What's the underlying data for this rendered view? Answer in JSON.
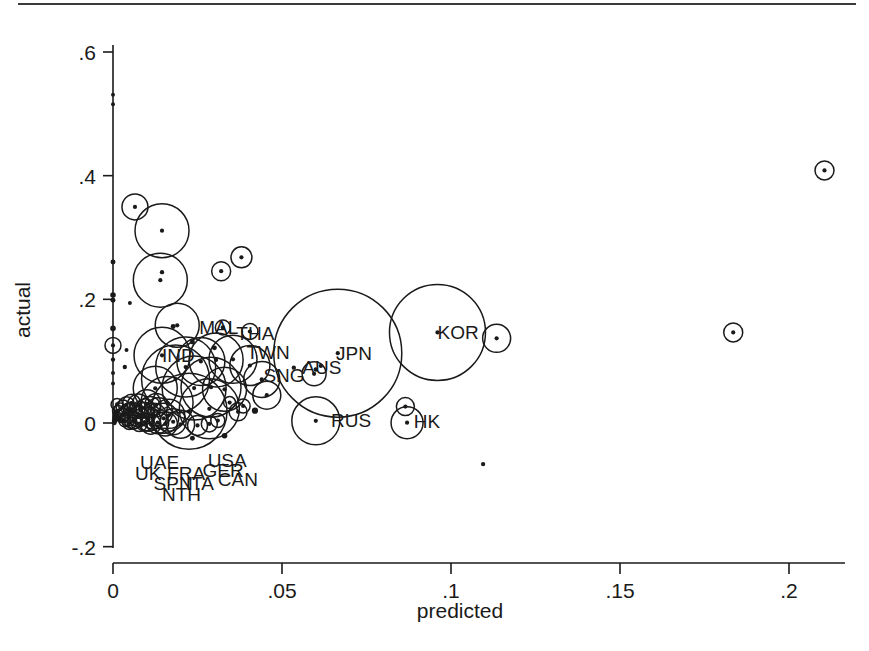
{
  "figure": {
    "type": "scatter-bubble-plot",
    "background": "#ffffff",
    "ink_color": "#1a1a1a"
  },
  "chart_data": {
    "type": "scatter",
    "title": "",
    "subtitle": "",
    "xlabel": "predicted",
    "ylabel": "actual",
    "xlim": [
      -0.006,
      0.215
    ],
    "ylim": [
      -0.21,
      0.64
    ],
    "xticks": [
      "0",
      ".05",
      ".1",
      ".15",
      ".2"
    ],
    "xtick_values": [
      0,
      0.05,
      0.1,
      0.15,
      0.2
    ],
    "yticks": [
      ".6",
      ".4",
      ".2",
      "0",
      "-.2"
    ],
    "ytick_values": [
      0.6,
      0.4,
      0.2,
      0,
      -0.2
    ],
    "grid": false,
    "legend": null,
    "marker": "circle-with-center-dot",
    "size_encoding": "bubble radius encodes weight (e.g. trade share / size)",
    "annotations": [
      {
        "text": "MAL",
        "x": 0.0255,
        "y": 0.1555
      },
      {
        "text": "THA",
        "x": 0.0365,
        "y": 0.1455
      },
      {
        "text": "TWN",
        "x": 0.0395,
        "y": 0.1155
      },
      {
        "text": "IND",
        "x": 0.0145,
        "y": 0.1105
      },
      {
        "text": "SNG",
        "x": 0.0445,
        "y": 0.0775
      },
      {
        "text": "AUS",
        "x": 0.056,
        "y": 0.0905
      },
      {
        "text": "JPN",
        "x": 0.066,
        "y": 0.1125
      },
      {
        "text": "KOR",
        "x": 0.096,
        "y": 0.1465
      },
      {
        "text": "RUS",
        "x": 0.0645,
        "y": 0.0055
      },
      {
        "text": "HK",
        "x": 0.089,
        "y": 0.0025
      },
      {
        "text": "UAE",
        "x": 0.008,
        "y": -0.0635
      },
      {
        "text": "USA",
        "x": 0.028,
        "y": -0.0595
      },
      {
        "text": "UK",
        "x": 0.0065,
        "y": -0.0815
      },
      {
        "text": "FRA",
        "x": 0.016,
        "y": -0.0805
      },
      {
        "text": "GER",
        "x": 0.0265,
        "y": -0.0765
      },
      {
        "text": "SPN",
        "x": 0.012,
        "y": -0.0975
      },
      {
        "text": "ITA",
        "x": 0.0215,
        "y": -0.0975
      },
      {
        "text": "CAN",
        "x": 0.031,
        "y": -0.0905
      },
      {
        "text": "NTH",
        "x": 0.0145,
        "y": -0.1155
      }
    ],
    "points": [
      {
        "x": 0.0,
        "y": 0.531,
        "r": 3.0
      },
      {
        "x": 0.0,
        "y": 0.5155,
        "r": 3.0
      },
      {
        "x": 0.0065,
        "y": 0.3495,
        "r": 13.0
      },
      {
        "x": 0.0,
        "y": 0.2605,
        "r": 4.0
      },
      {
        "x": 0.014,
        "y": 0.231,
        "r": 27.0
      },
      {
        "x": 0.0,
        "y": 0.207,
        "r": 4.5
      },
      {
        "x": 0.0,
        "y": 0.1985,
        "r": 4.0
      },
      {
        "x": 0.005,
        "y": 0.194,
        "r": 3.0
      },
      {
        "x": 0.0,
        "y": 0.153,
        "r": 4.5
      },
      {
        "x": 0.0,
        "y": 0.1255,
        "r": 8.0
      },
      {
        "x": 0.004,
        "y": 0.118,
        "r": 3.0
      },
      {
        "x": 0.0,
        "y": 0.1025,
        "r": 3.5
      },
      {
        "x": 0.0035,
        "y": 0.0905,
        "r": 3.5
      },
      {
        "x": 0.0,
        "y": 0.081,
        "r": 3.0
      },
      {
        "x": 0.0,
        "y": 0.064,
        "r": 3.0
      },
      {
        "x": 0.0145,
        "y": 0.311,
        "r": 27.0
      },
      {
        "x": 0.0145,
        "y": 0.244,
        "r": 3.5
      },
      {
        "x": 0.032,
        "y": 0.2455,
        "r": 9.5
      },
      {
        "x": 0.038,
        "y": 0.268,
        "r": 10.5
      },
      {
        "x": 0.019,
        "y": 0.158,
        "r": 22.0
      },
      {
        "x": 0.0325,
        "y": 0.1545,
        "r": 7.5
      },
      {
        "x": 0.0665,
        "y": 0.113,
        "r": 64.0
      },
      {
        "x": 0.096,
        "y": 0.1465,
        "r": 48.0
      },
      {
        "x": 0.1135,
        "y": 0.137,
        "r": 14.0
      },
      {
        "x": 0.1835,
        "y": 0.1465,
        "r": 9.5
      },
      {
        "x": 0.2105,
        "y": 0.4085,
        "r": 9.5
      },
      {
        "x": 0.0595,
        "y": 0.0795,
        "r": 12.0
      },
      {
        "x": 0.0535,
        "y": 0.0895,
        "r": 3.5
      },
      {
        "x": 0.0615,
        "y": 0.0925,
        "r": 3.5
      },
      {
        "x": 0.06,
        "y": 0.0865,
        "r": 3.5
      },
      {
        "x": 0.06,
        "y": 0.0035,
        "r": 24.0
      },
      {
        "x": 0.087,
        "y": 0.0005,
        "r": 16.0
      },
      {
        "x": 0.0865,
        "y": 0.0265,
        "r": 9.0
      },
      {
        "x": 0.1095,
        "y": -0.0665,
        "r": 3.5
      },
      {
        "x": 0.033,
        "y": -0.0205,
        "r": 4.5
      },
      {
        "x": 0.0235,
        "y": -0.0245,
        "r": 4.0
      },
      {
        "x": 0.0145,
        "y": 0.1095,
        "r": 28.0
      },
      {
        "x": 0.0215,
        "y": 0.0905,
        "r": 30.0
      },
      {
        "x": 0.026,
        "y": 0.0995,
        "r": 24.0
      },
      {
        "x": 0.0305,
        "y": 0.102,
        "r": 27.0
      },
      {
        "x": 0.0355,
        "y": 0.103,
        "r": 24.0
      },
      {
        "x": 0.0405,
        "y": 0.093,
        "r": 20.0
      },
      {
        "x": 0.044,
        "y": 0.0705,
        "r": 18.0
      },
      {
        "x": 0.0455,
        "y": 0.045,
        "r": 14.0
      },
      {
        "x": 0.0185,
        "y": 0.071,
        "r": 34.0
      },
      {
        "x": 0.024,
        "y": 0.0565,
        "r": 32.0
      },
      {
        "x": 0.029,
        "y": 0.058,
        "r": 30.0
      },
      {
        "x": 0.033,
        "y": 0.0545,
        "r": 22.0
      },
      {
        "x": 0.0125,
        "y": 0.056,
        "r": 22.0
      },
      {
        "x": 0.016,
        "y": 0.033,
        "r": 26.0
      },
      {
        "x": 0.0225,
        "y": 0.019,
        "r": 38.0
      },
      {
        "x": 0.0285,
        "y": 0.023,
        "r": 30.0
      },
      {
        "x": 0.01,
        "y": 0.031,
        "r": 14.0
      },
      {
        "x": 0.0075,
        "y": 0.029,
        "r": 11.0
      },
      {
        "x": 0.0055,
        "y": 0.032,
        "r": 9.0
      },
      {
        "x": 0.004,
        "y": 0.0295,
        "r": 8.0
      },
      {
        "x": 0.003,
        "y": 0.026,
        "r": 7.0
      },
      {
        "x": 0.0022,
        "y": 0.0225,
        "r": 6.0
      },
      {
        "x": 0.0015,
        "y": 0.0195,
        "r": 5.5
      },
      {
        "x": 0.001,
        "y": 0.016,
        "r": 5.0
      },
      {
        "x": 0.0008,
        "y": 0.012,
        "r": 5.0
      },
      {
        "x": 0.0006,
        "y": 0.008,
        "r": 4.5
      },
      {
        "x": 0.0005,
        "y": 0.004,
        "r": 4.5
      },
      {
        "x": 0.0004,
        "y": 0.0005,
        "r": 4.0
      },
      {
        "x": 0.0012,
        "y": 0.03,
        "r": 6.0
      },
      {
        "x": 0.003,
        "y": 0.012,
        "r": 7.0
      },
      {
        "x": 0.0045,
        "y": 0.008,
        "r": 8.0
      },
      {
        "x": 0.006,
        "y": 0.0045,
        "r": 9.0
      },
      {
        "x": 0.0075,
        "y": 0.01,
        "r": 10.0
      },
      {
        "x": 0.009,
        "y": 0.015,
        "r": 11.0
      },
      {
        "x": 0.0105,
        "y": 0.006,
        "r": 12.0
      },
      {
        "x": 0.012,
        "y": 0.011,
        "r": 13.0
      },
      {
        "x": 0.0135,
        "y": 0.018,
        "r": 14.0
      },
      {
        "x": 0.015,
        "y": 0.0075,
        "r": 15.0
      },
      {
        "x": 0.0165,
        "y": 0.0125,
        "r": 16.0
      },
      {
        "x": 0.005,
        "y": 0.023,
        "r": 6.5
      },
      {
        "x": 0.0065,
        "y": 0.019,
        "r": 7.5
      },
      {
        "x": 0.008,
        "y": 0.0215,
        "r": 8.5
      },
      {
        "x": 0.0095,
        "y": 0.024,
        "r": 9.5
      },
      {
        "x": 0.011,
        "y": 0.026,
        "r": 10.5
      },
      {
        "x": 0.0128,
        "y": 0.029,
        "r": 11.5
      },
      {
        "x": 0.0018,
        "y": 0.007,
        "r": 5.0
      },
      {
        "x": 0.0024,
        "y": 0.0045,
        "r": 5.0
      },
      {
        "x": 0.0035,
        "y": 0.0035,
        "r": 6.0
      },
      {
        "x": 0.0048,
        "y": 0.0,
        "r": 6.5
      },
      {
        "x": 0.0062,
        "y": 0.002,
        "r": 7.0
      },
      {
        "x": 0.0078,
        "y": -0.001,
        "r": 8.0
      },
      {
        "x": 0.0094,
        "y": 0.0015,
        "r": 9.0
      },
      {
        "x": 0.0112,
        "y": -0.002,
        "r": 10.0
      },
      {
        "x": 0.0132,
        "y": 0.0005,
        "r": 11.0
      },
      {
        "x": 0.0155,
        "y": -0.0015,
        "r": 12.0
      },
      {
        "x": 0.0178,
        "y": 0.002,
        "r": 13.0
      },
      {
        "x": 0.02,
        "y": -0.002,
        "r": 14.0
      },
      {
        "x": 0.025,
        "y": -0.004,
        "r": 10.0
      },
      {
        "x": 0.0285,
        "y": -0.0015,
        "r": 8.0
      },
      {
        "x": 0.031,
        "y": 0.004,
        "r": 7.0
      },
      {
        "x": 0.037,
        "y": 0.018,
        "r": 9.0
      },
      {
        "x": 0.0385,
        "y": 0.0275,
        "r": 7.0
      },
      {
        "x": 0.042,
        "y": 0.02,
        "r": 5.0
      },
      {
        "x": 0.0345,
        "y": 0.033,
        "r": 6.0
      },
      {
        "x": 0.0235,
        "y": 0.131,
        "r": 4.0
      },
      {
        "x": 0.03,
        "y": 0.1215,
        "r": 4.0
      },
      {
        "x": 0.0178,
        "y": 0.156,
        "r": 4.0
      },
      {
        "x": 0.0405,
        "y": 0.148,
        "r": 8.0
      }
    ]
  }
}
